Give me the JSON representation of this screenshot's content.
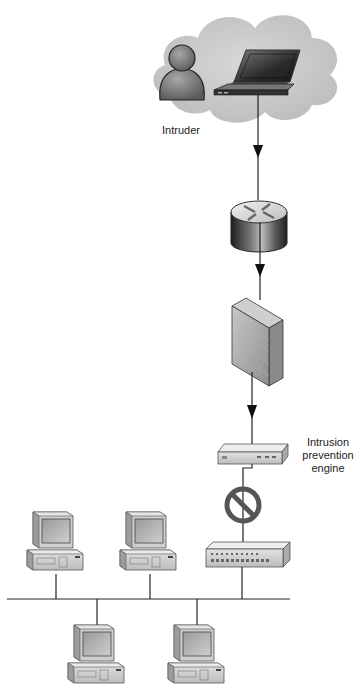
{
  "diagram": {
    "type": "network-topology",
    "nodes": [
      {
        "id": "cloud",
        "kind": "internet-cloud"
      },
      {
        "id": "intruder",
        "kind": "user",
        "label": "Intruder"
      },
      {
        "id": "laptop",
        "kind": "laptop"
      },
      {
        "id": "router",
        "kind": "router"
      },
      {
        "id": "firewall",
        "kind": "firewall"
      },
      {
        "id": "ips",
        "kind": "intrusion-prevention-device",
        "label": "Intrusion prevention engine"
      },
      {
        "id": "block",
        "kind": "prohibited-symbol"
      },
      {
        "id": "switch",
        "kind": "switch-hub"
      },
      {
        "id": "pc1",
        "kind": "workstation"
      },
      {
        "id": "pc2",
        "kind": "workstation"
      },
      {
        "id": "pc3",
        "kind": "workstation"
      },
      {
        "id": "pc4",
        "kind": "workstation"
      }
    ],
    "edges": [
      {
        "from": "laptop",
        "to": "router",
        "arrow": true
      },
      {
        "from": "router",
        "to": "firewall",
        "arrow": true
      },
      {
        "from": "firewall",
        "to": "ips",
        "arrow": true
      },
      {
        "from": "ips",
        "to": "switch",
        "blocked": true
      },
      {
        "from": "switch",
        "to": "lan-bus"
      },
      {
        "from": "pc1",
        "to": "lan-bus"
      },
      {
        "from": "pc2",
        "to": "lan-bus"
      },
      {
        "from": "lan-bus",
        "to": "pc3"
      },
      {
        "from": "lan-bus",
        "to": "pc4"
      }
    ]
  },
  "labels": {
    "intruder": "Intruder",
    "ips_line1": "Intrusion",
    "ips_line2": "prevention",
    "ips_line3": "engine"
  }
}
